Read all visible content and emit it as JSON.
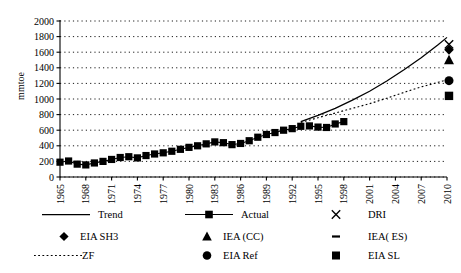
{
  "figure": {
    "title": "",
    "width": 461,
    "height": 273,
    "background": "#ffffff",
    "foreground": "#000000"
  },
  "chart_data": {
    "type": "line",
    "title": "",
    "xlabel": "",
    "ylabel": "mmtoe",
    "xlim": [
      1965,
      2010
    ],
    "ylim": [
      0,
      2000
    ],
    "ytick_step": 200,
    "xtick_step": 3,
    "grid": true,
    "legend_position": "bottom",
    "yticks": [
      0,
      200,
      400,
      600,
      800,
      1000,
      1200,
      1400,
      1600,
      1800,
      2000
    ],
    "xticks": [
      1965,
      1968,
      1971,
      1974,
      1977,
      1980,
      1983,
      1986,
      1989,
      1992,
      1995,
      1998,
      2001,
      2004,
      2007,
      2010
    ],
    "series": [
      {
        "name": "Actual",
        "style": "line-marker",
        "marker": "square",
        "x": [
          1965,
          1966,
          1967,
          1968,
          1969,
          1970,
          1971,
          1972,
          1973,
          1974,
          1975,
          1976,
          1977,
          1978,
          1979,
          1980,
          1981,
          1982,
          1983,
          1984,
          1985,
          1986,
          1987,
          1988,
          1989,
          1990,
          1991,
          1992,
          1993
        ],
        "values": [
          190,
          205,
          165,
          155,
          180,
          200,
          225,
          250,
          260,
          245,
          275,
          295,
          310,
          330,
          355,
          380,
          400,
          425,
          450,
          440,
          415,
          430,
          465,
          510,
          545,
          570,
          600,
          620,
          650
        ]
      },
      {
        "name": "Actual (cont.)",
        "style": "line-marker",
        "marker": "square",
        "x": [
          1994,
          1995,
          1996,
          1997,
          1998
        ],
        "values": [
          655,
          640,
          635,
          680,
          710
        ]
      },
      {
        "name": "Trend",
        "style": "solid-line",
        "marker": "none",
        "x": [
          1993,
          1995,
          1997,
          1999,
          2001,
          2003,
          2005,
          2007,
          2009,
          2010
        ],
        "values": [
          710,
          790,
          880,
          985,
          1100,
          1230,
          1375,
          1530,
          1700,
          1790
        ]
      },
      {
        "name": "ZF",
        "style": "dotted-line",
        "marker": "none",
        "x": [
          1993,
          1995,
          1997,
          1999,
          2001,
          2003,
          2005,
          2007,
          2009,
          2010
        ],
        "values": [
          700,
          760,
          820,
          880,
          940,
          1010,
          1085,
          1155,
          1215,
          1245
        ]
      }
    ],
    "endpoints": [
      {
        "name": "DRI",
        "marker": "x",
        "x": 2010,
        "value": 1700
      },
      {
        "name": "EIA SH3",
        "marker": "diamond",
        "x": 2010,
        "value": 1630
      },
      {
        "name": "IEA (CC)",
        "marker": "triangle",
        "x": 2010,
        "value": 1500
      },
      {
        "name": "EIA Ref",
        "marker": "circle",
        "x": 2010,
        "value": 1235
      },
      {
        "name": "EIA SL",
        "marker": "square",
        "x": 2010,
        "value": 1040
      }
    ]
  },
  "axes": {
    "y_axis_title": "mmtoe",
    "y_tick_labels": [
      "2000",
      "1800",
      "1600",
      "1400",
      "1200",
      "1000",
      "800",
      "600",
      "400",
      "200",
      "0"
    ],
    "x_tick_labels": [
      "1965",
      "1968",
      "1971",
      "1974",
      "1977",
      "1980",
      "1983",
      "1986",
      "1989",
      "1992",
      "1995",
      "1998",
      "2001",
      "2004",
      "2007",
      "2010"
    ]
  },
  "legend": {
    "rows": [
      [
        {
          "label": "Trend",
          "glyph": "solid-line"
        },
        {
          "label": "Actual",
          "glyph": "line-square"
        },
        {
          "label": "DRI",
          "glyph": "x-cross"
        }
      ],
      [
        {
          "label": "EIA SH3",
          "glyph": "diamond"
        },
        {
          "label": "IEA (CC)",
          "glyph": "triangle"
        },
        {
          "label": "IEA( ES)",
          "glyph": "dash"
        }
      ],
      [
        {
          "label": "ZF",
          "glyph": "dotted-line"
        },
        {
          "label": "EIA  Ref",
          "glyph": "circle"
        },
        {
          "label": "EIA SL",
          "glyph": "square"
        }
      ]
    ]
  }
}
